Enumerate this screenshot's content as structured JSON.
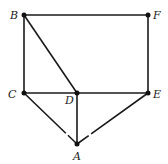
{
  "diagram": {
    "type": "graph",
    "nodes": [
      {
        "id": "A",
        "label": "A",
        "x": 77,
        "y": 144,
        "lx": 73,
        "ly": 160
      },
      {
        "id": "B",
        "label": "B",
        "x": 24,
        "y": 15,
        "lx": 10,
        "ly": 19
      },
      {
        "id": "C",
        "label": "C",
        "x": 24,
        "y": 93,
        "lx": 8,
        "ly": 98
      },
      {
        "id": "D",
        "label": "D",
        "x": 77,
        "y": 93,
        "lx": 65,
        "ly": 104
      },
      {
        "id": "E",
        "label": "E",
        "x": 148,
        "y": 93,
        "lx": 153,
        "ly": 98
      },
      {
        "id": "F",
        "label": "F",
        "x": 148,
        "y": 15,
        "lx": 153,
        "ly": 19
      }
    ],
    "edges": [
      [
        "B",
        "F"
      ],
      [
        "B",
        "C"
      ],
      [
        "B",
        "D"
      ],
      [
        "F",
        "E"
      ],
      [
        "C",
        "D"
      ],
      [
        "D",
        "E"
      ],
      [
        "D",
        "A"
      ],
      [
        "C",
        "A"
      ],
      [
        "E",
        "A"
      ]
    ],
    "line_color": "#1a1a1a"
  }
}
